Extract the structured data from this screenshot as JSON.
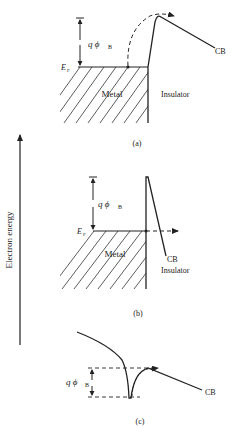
{
  "axis": {
    "label": "Electron energy"
  },
  "panels": [
    {
      "id": "a",
      "caption": "(a)",
      "barrier_label": "q ϕ",
      "barrier_subscript": "B",
      "fermi_label": "E",
      "fermi_subscript": "F",
      "metal_label": "Metal",
      "insulator_label": "Insulator",
      "band_label": "CB",
      "mechanism": "thermionic emission over barrier"
    },
    {
      "id": "b",
      "caption": "(b)",
      "barrier_label": "q ϕ",
      "barrier_subscript": "B",
      "fermi_label": "E",
      "fermi_subscript": "F",
      "metal_label": "Metal",
      "insulator_label": "Insulator",
      "band_label": "CB",
      "mechanism": "tunneling through thin barrier"
    },
    {
      "id": "c",
      "caption": "(c)",
      "barrier_label": "q ϕ",
      "barrier_subscript": "B",
      "band_label": "CB",
      "mechanism": "emission from trap"
    }
  ],
  "colors": {
    "ink": "#222222",
    "background": "#ffffff"
  }
}
